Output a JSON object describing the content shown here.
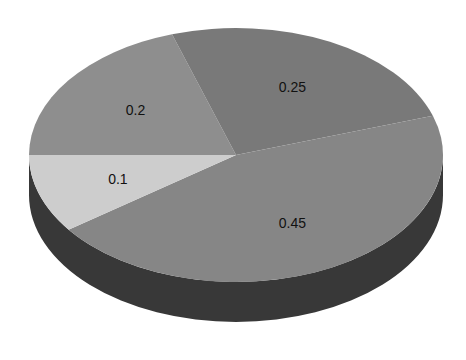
{
  "chart_data": {
    "type": "pie",
    "style": "3d",
    "title": "",
    "categories": [
      "0.2",
      "0.25",
      "0.45",
      "0.1"
    ],
    "values": [
      0.2,
      0.25,
      0.45,
      0.1
    ],
    "labels": [
      "0.2",
      "0.25",
      "0.45",
      "0.1"
    ],
    "colors": [
      "#8e8e8e",
      "#797979",
      "#868686",
      "#cdcdcd"
    ],
    "side_color": "#383838",
    "legend": null,
    "start_angle_deg": 180,
    "direction": "clockwise"
  },
  "geometry": {
    "cx": 236,
    "cy": 155,
    "rx": 207,
    "ry": 127,
    "depth": 40
  }
}
